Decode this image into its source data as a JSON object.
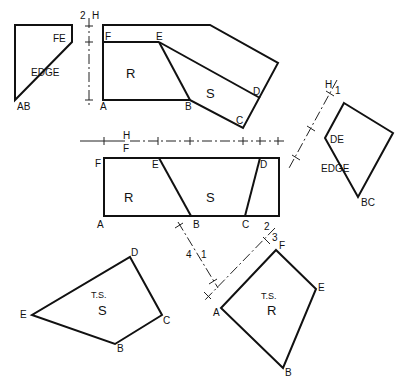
{
  "figure": {
    "views": {
      "side_view": {
        "label_fe": "FE",
        "label_edge": "EDGE",
        "label_ab": "AB"
      },
      "top_view": {
        "F": "F",
        "E": "E",
        "A": "A",
        "B": "B",
        "C": "C",
        "D": "D",
        "R": "R",
        "S": "S"
      },
      "front_view": {
        "F": "F",
        "E": "E",
        "A": "A",
        "B": "B",
        "C": "C",
        "D": "D",
        "R": "R",
        "S": "S"
      },
      "aux1_view": {
        "DE": "DE",
        "EDGE": "EDGE",
        "BC": "BC"
      },
      "ts_s_view": {
        "ts": "T.S.",
        "S": "S",
        "D": "D",
        "E": "E",
        "C": "C",
        "B": "B"
      },
      "ts_r_view": {
        "ts": "T.S.",
        "R": "R",
        "F": "F",
        "E": "E",
        "A": "A",
        "B": "B"
      }
    },
    "reference_lines": {
      "vertical_2H": {
        "top": "2",
        "bottom": "H"
      },
      "horizontal_HF": {
        "top": "H",
        "bottom": "F"
      },
      "diag_H1": {
        "top": "H",
        "bottom": "1"
      },
      "diag_41": {
        "left": "4",
        "right": "1"
      },
      "diag_23": {
        "top": "2",
        "bottom": "3"
      }
    }
  }
}
